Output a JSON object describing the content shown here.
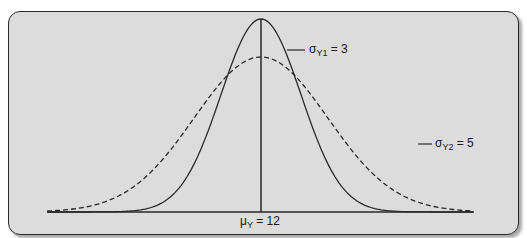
{
  "chart_data": {
    "type": "line",
    "title": "",
    "xlabel": "",
    "ylabel": "",
    "grid": false,
    "mean": 12,
    "mean_label": "μY = 12",
    "series": [
      {
        "name": "σY1 = 3",
        "sigma": 3,
        "style": "solid",
        "color": "#2a2a2a"
      },
      {
        "name": "σY2 = 5",
        "sigma": 5,
        "style": "dashed",
        "color": "#2a2a2a"
      }
    ],
    "x_range": [
      -3,
      27
    ],
    "annotations": [
      "σY1 = 3",
      "σY2 = 5",
      "μY = 12"
    ]
  },
  "labels": {
    "sigma1_sym": "σ",
    "sigma1_sub": "Y1",
    "sigma1_val": " = 3",
    "sigma2_sym": "σ",
    "sigma2_sub": "Y2",
    "sigma2_val": " = 5",
    "mu_sym": "μ",
    "mu_sub": "Y",
    "mu_val": " = 12"
  },
  "colors": {
    "panel": "#dcdcdc",
    "ink": "#2a2a2a"
  }
}
